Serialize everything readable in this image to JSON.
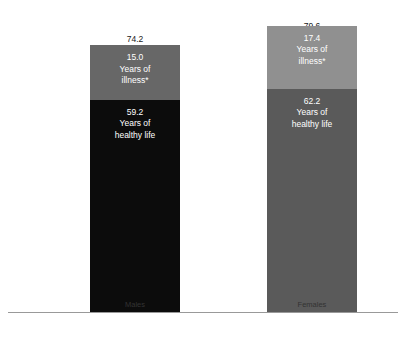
{
  "chart_data": {
    "type": "bar",
    "subtype": "stacked",
    "title": "",
    "xlabel": "",
    "ylabel": "",
    "categories": [
      "Males",
      "Females"
    ],
    "unit": "years",
    "ylim": [
      0,
      79.6
    ],
    "grid": false,
    "legend": "none",
    "series": [
      {
        "name": "Years of healthy life",
        "values": [
          59.2,
          62.2
        ],
        "colors": [
          "#0c0c0c",
          "#5a5a5a"
        ]
      },
      {
        "name": "Years of illness*",
        "values": [
          15.0,
          17.4
        ],
        "colors": [
          "#676767",
          "#909090"
        ]
      }
    ],
    "totals": [
      74.2,
      79.6
    ],
    "total_label": "Years of life"
  },
  "axis": {
    "baseline_color": "#999999",
    "categories": [
      {
        "label": "Males"
      },
      {
        "label": "Females"
      }
    ]
  },
  "bars": [
    {
      "key": "males",
      "category": "Males",
      "total_value": "74.2",
      "total_unit": "Years of life",
      "segments": [
        {
          "key": "illness",
          "value": "15.0",
          "unit_line1": "Years of",
          "unit_line2": "illness*",
          "color": "#676767",
          "text_color": "#ffffff"
        },
        {
          "key": "healthy",
          "value": "59.2",
          "unit_line1": "Years of",
          "unit_line2": "healthy life",
          "color": "#0c0c0c",
          "text_color": "#ffffff"
        }
      ]
    },
    {
      "key": "females",
      "category": "Females",
      "total_value": "79.6",
      "total_unit": "Years of life",
      "segments": [
        {
          "key": "illness",
          "value": "17.4",
          "unit_line1": "Years of",
          "unit_line2": "illness*",
          "color": "#909090",
          "text_color": "#ffffff"
        },
        {
          "key": "healthy",
          "value": "62.2",
          "unit_line1": "Years of",
          "unit_line2": "healthy life",
          "color": "#5a5a5a",
          "text_color": "#ffffff"
        }
      ]
    }
  ]
}
